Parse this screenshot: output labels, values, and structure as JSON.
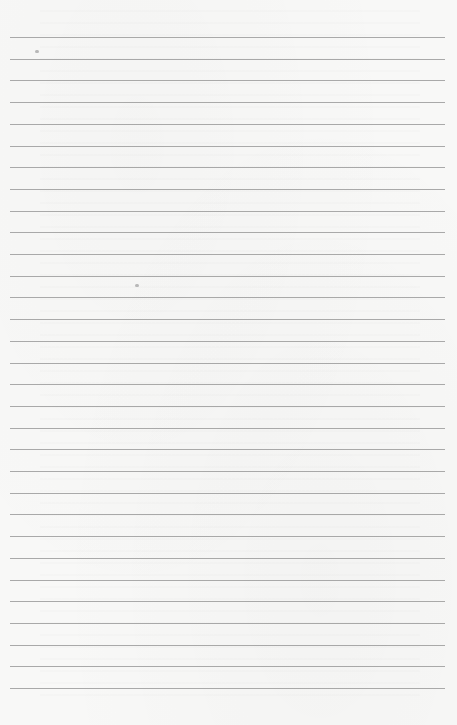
{
  "page": {
    "type": "lined-paper",
    "background_color": "#f8f8f7",
    "rule_color": "#8f8f8f",
    "rule_count": 31,
    "first_rule_y": 37,
    "rule_spacing": 21.7,
    "rule_left": 10,
    "rule_width": 435
  },
  "marks": [
    {
      "name": "smudge-top-left",
      "x": 35,
      "y": 50
    },
    {
      "name": "smudge-middle",
      "x": 135,
      "y": 284
    }
  ]
}
